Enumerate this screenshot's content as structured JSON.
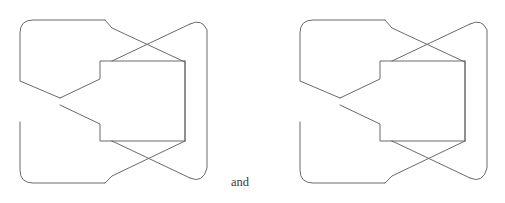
{
  "figure": {
    "kind": "knot-diagram-pair",
    "background_color": "#ffffff",
    "stroke_color": "#6a6a6a",
    "stroke_width": 1,
    "text_color": "#3a3a3a",
    "conjunction": {
      "label": "and",
      "x": 231,
      "y": 186,
      "font_size": 12.5
    },
    "diagrams": [
      {
        "name": "left-knot-diagram",
        "offset_x": 0,
        "offset_y": 0,
        "bounds": {
          "x": 18,
          "y": 10,
          "width": 192,
          "height": 182
        }
      },
      {
        "name": "right-knot-diagram",
        "offset_x": 280,
        "offset_y": 0,
        "bounds": {
          "x": 298,
          "y": 10,
          "width": 192,
          "height": 182
        }
      }
    ],
    "crossings": [
      {
        "name": "top-crossing",
        "x": 144,
        "y": 48
      },
      {
        "name": "middle-crossing",
        "x": 64,
        "y": 102
      },
      {
        "name": "bottom-crossing",
        "x": 144,
        "y": 156
      }
    ],
    "strands": {
      "outer_left_upper": "M 108 21 L 33 21 Q 20 21 20 34 L 20 81 L 66 100",
      "outer_left_lower": "M 20 121 L 20 169 Q 20 182 33 182 L 108 182",
      "upper_diagonal_down": "M 108 21 L 207 63",
      "upper_diagonal_up": "M 108 81 L 207 32",
      "mid_upper_to_center": "M 66 100 L 100 81 L 100 62 L 152 62",
      "mid_center_lower": "M 100 121 L 100 140 L 152 140",
      "mid_lower_from_cross": "M 66 104 L 100 121",
      "right_vertical_upper": "M 183 62 L 183 140",
      "right_cap_top": "M 199 21 Q 210 21 210 36 L 210 100",
      "right_cap_bottom": "M 210 103 L 210 167 Q 210 182 199 182",
      "lower_diagonal_down": "M 108 182 L 207 140",
      "lower_diagonal_up": "M 108 121 L 207 171"
    }
  }
}
